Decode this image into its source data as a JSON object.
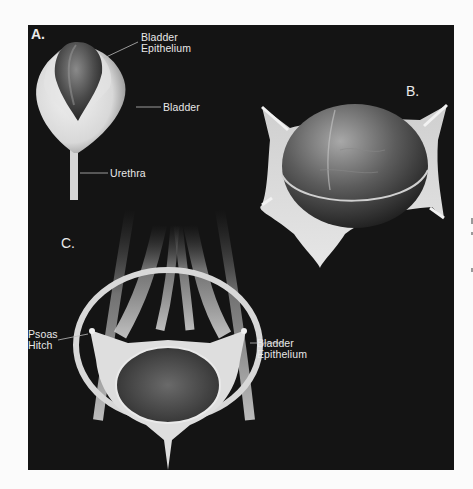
{
  "figure": {
    "background_color": "#141414",
    "page_color": "#fbfbfb",
    "panels": [
      {
        "id": "A",
        "letter": "A.",
        "labels": [
          {
            "line1": "Bladder",
            "line2": "Epithelium"
          },
          {
            "line1": "Bladder"
          },
          {
            "line1": "Urethra"
          }
        ]
      },
      {
        "id": "B",
        "letter": "B.",
        "labels": []
      },
      {
        "id": "C",
        "letter": "C.",
        "labels": [
          {
            "line1": "Psoas",
            "line2": "Hitch"
          },
          {
            "line1": "Bladder",
            "line2": "Epithelium"
          }
        ]
      }
    ]
  }
}
